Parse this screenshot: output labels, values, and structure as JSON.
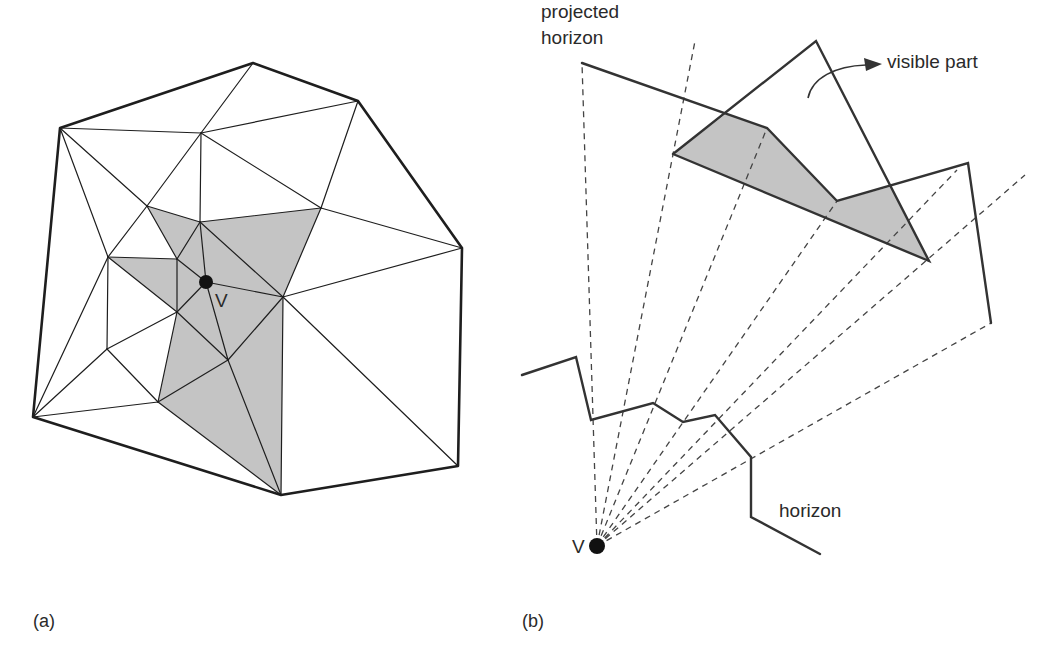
{
  "figure": {
    "panel_a": {
      "caption": "(a)",
      "caption_pos": [
        33,
        627
      ],
      "viewpoint_label": "V",
      "viewpoint_label_pos": [
        215,
        307
      ],
      "viewpoint": [
        206,
        282
      ],
      "viewpoint_radius": 7,
      "vertices": {
        "P1": [
          60,
          128
        ],
        "P2": [
          253,
          63
        ],
        "P3": [
          358,
          101
        ],
        "P4": [
          462,
          248
        ],
        "P5": [
          458,
          466
        ],
        "P6": [
          281,
          495
        ],
        "P7": [
          33,
          417
        ],
        "A": [
          201,
          133
        ],
        "B": [
          321,
          208
        ],
        "C": [
          147,
          206
        ],
        "D": [
          200,
          222
        ],
        "E": [
          108,
          257
        ],
        "F": [
          177,
          259
        ],
        "V": [
          206,
          282
        ],
        "G": [
          283,
          297
        ],
        "H": [
          177,
          312
        ],
        "I": [
          107,
          349
        ],
        "J": [
          228,
          360
        ],
        "K": [
          158,
          402
        ]
      },
      "hull": [
        "P1",
        "P2",
        "P3",
        "P4",
        "P5",
        "P6",
        "P7"
      ],
      "edges": [
        [
          "P1",
          "A"
        ],
        [
          "P2",
          "A"
        ],
        [
          "P3",
          "A"
        ],
        [
          "A",
          "D"
        ],
        [
          "A",
          "B"
        ],
        [
          "A",
          "C"
        ],
        [
          "P3",
          "B"
        ],
        [
          "B",
          "P4"
        ],
        [
          "B",
          "G"
        ],
        [
          "B",
          "D"
        ],
        [
          "P1",
          "C"
        ],
        [
          "P1",
          "E"
        ],
        [
          "C",
          "E"
        ],
        [
          "C",
          "D"
        ],
        [
          "C",
          "F"
        ],
        [
          "E",
          "F"
        ],
        [
          "E",
          "H"
        ],
        [
          "E",
          "I"
        ],
        [
          "E",
          "P7"
        ],
        [
          "F",
          "D"
        ],
        [
          "F",
          "V"
        ],
        [
          "F",
          "H"
        ],
        [
          "D",
          "V"
        ],
        [
          "D",
          "G"
        ],
        [
          "V",
          "G"
        ],
        [
          "V",
          "H"
        ],
        [
          "V",
          "J"
        ],
        [
          "G",
          "P4"
        ],
        [
          "G",
          "P5"
        ],
        [
          "G",
          "P6"
        ],
        [
          "G",
          "J"
        ],
        [
          "H",
          "I"
        ],
        [
          "H",
          "J"
        ],
        [
          "H",
          "K"
        ],
        [
          "I",
          "K"
        ],
        [
          "I",
          "P7"
        ],
        [
          "K",
          "P7"
        ],
        [
          "K",
          "J"
        ],
        [
          "J",
          "P6"
        ],
        [
          "K",
          "P6"
        ]
      ],
      "shaded_triangles": [
        [
          "C",
          "D",
          "F"
        ],
        [
          "D",
          "B",
          "G"
        ],
        [
          "D",
          "V",
          "G"
        ],
        [
          "D",
          "F",
          "V"
        ],
        [
          "E",
          "F",
          "H"
        ],
        [
          "F",
          "V",
          "H"
        ],
        [
          "H",
          "V",
          "J"
        ],
        [
          "V",
          "G",
          "J"
        ],
        [
          "H",
          "J",
          "K"
        ],
        [
          "J",
          "K",
          "P6"
        ],
        [
          "J",
          "G",
          "P6"
        ]
      ]
    },
    "panel_b": {
      "caption": "(b)",
      "caption_pos": [
        522,
        627
      ],
      "viewpoint_label": "V",
      "viewpoint_label_pos": [
        572,
        553
      ],
      "viewpoint": [
        597,
        546
      ],
      "viewpoint_radius": 8,
      "projected_horizon_label": [
        "projected",
        "horizon"
      ],
      "projected_horizon_label_pos": [
        541,
        18
      ],
      "horizon_label": "horizon",
      "horizon_label_pos": [
        779,
        517
      ],
      "visible_part_label": "visible part",
      "visible_part_label_pos": [
        887,
        68
      ],
      "projected_horizon": [
        [
          582,
          63
        ],
        [
          767,
          128
        ],
        [
          837,
          201
        ],
        [
          968,
          163
        ],
        [
          991,
          323
        ]
      ],
      "triangle": [
        [
          673,
          154
        ],
        [
          816,
          41
        ],
        [
          929,
          261
        ]
      ],
      "visible_region": [
        [
          673,
          154
        ],
        [
          726,
          114
        ],
        [
          767,
          128
        ],
        [
          837,
          201
        ],
        [
          890,
          187
        ],
        [
          929,
          261
        ]
      ],
      "horizon": [
        [
          522,
          375
        ],
        [
          576,
          357
        ],
        [
          591,
          420
        ],
        [
          653,
          403
        ],
        [
          683,
          422
        ],
        [
          715,
          415
        ],
        [
          751,
          457
        ],
        [
          751,
          517
        ],
        [
          820,
          554
        ]
      ],
      "rays_to": [
        [
          582,
          63
        ],
        [
          695,
          41
        ],
        [
          767,
          128
        ],
        [
          837,
          201
        ],
        [
          957,
          170
        ],
        [
          1025,
          175
        ],
        [
          991,
          323
        ]
      ],
      "arrow": {
        "path": "M808,98 C812,78 835,66 866,65",
        "head": [
          [
            882,
            64
          ],
          [
            864,
            58
          ],
          [
            866,
            71
          ]
        ]
      }
    }
  }
}
